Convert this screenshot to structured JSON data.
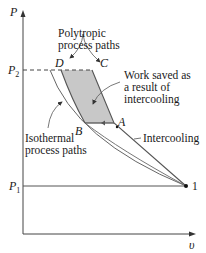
{
  "diagram": {
    "type": "P-v diagram",
    "axes": {
      "y_label": "P",
      "x_label": "υ",
      "y_ticks": [
        {
          "label": "P",
          "subscript": "2"
        },
        {
          "label": "P",
          "subscript": "1"
        }
      ]
    },
    "points": [
      {
        "label": "D"
      },
      {
        "label": "C"
      },
      {
        "label": "B"
      },
      {
        "label": "A"
      },
      {
        "label": "1"
      }
    ],
    "annotations": {
      "polytropic": [
        "Polytropic",
        "process paths"
      ],
      "work_saved": [
        "Work saved as",
        "a result of",
        "intercooling"
      ],
      "isothermal": [
        "Isothermal",
        "process paths"
      ],
      "intercooling": "Intercooling"
    },
    "colors": {
      "shaded_region": "#c8c8c8",
      "lines": "#555555",
      "text": "#1a1a1a"
    }
  }
}
